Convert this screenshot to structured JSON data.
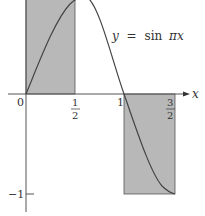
{
  "diagram": {
    "function_label": {
      "y": "y",
      "eq": "=",
      "fn": "sin",
      "arg": "πx"
    },
    "axis": {
      "x_label": "x"
    },
    "ticks": {
      "origin": "0",
      "half_num": "1",
      "half_den": "2",
      "one": "1",
      "three_half_num": "3",
      "three_half_den": "2",
      "neg_one": "−1"
    },
    "colors": {
      "rect_fill": "#b8b8b8",
      "curve": "#444444",
      "axis": "#555555"
    },
    "rectangles": [
      {
        "x_from": 0,
        "x_to": 0.5,
        "height": 1
      },
      {
        "x_from": 1,
        "x_to": 1.5,
        "height": -1
      }
    ]
  }
}
